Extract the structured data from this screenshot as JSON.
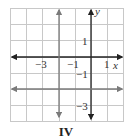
{
  "figure": {
    "caption": "IV",
    "axes": {
      "x_label": "x",
      "y_label": "y",
      "x_range": [
        -5,
        2
      ],
      "y_range": [
        -4,
        3
      ],
      "grid_step": 1
    },
    "tick_labels": {
      "x": [
        {
          "value": -3,
          "text": "−3"
        },
        {
          "value": -1,
          "text": "−1"
        },
        {
          "value": 1,
          "text": "1"
        }
      ],
      "y": [
        {
          "value": 1,
          "text": "1"
        },
        {
          "value": -1,
          "text": "−1"
        },
        {
          "value": -3,
          "text": "−3"
        }
      ]
    },
    "lines": [
      {
        "equation": "x = -2",
        "orientation": "vertical",
        "color": "#7a7a7a"
      },
      {
        "equation": "y = -2",
        "orientation": "horizontal",
        "color": "#7a7a7a"
      }
    ],
    "colors": {
      "grid": "#c8c8c8",
      "axis": "#222222",
      "graph_line": "#7a7a7a"
    }
  }
}
